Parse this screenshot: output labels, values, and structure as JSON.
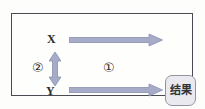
{
  "figure": {
    "nodes": {
      "x_label": "X",
      "y_label": "Y"
    },
    "annotations": {
      "arrow1_label": "①",
      "arrow2_label": "②"
    },
    "result_box_label": "结果",
    "colors": {
      "arrow_fill": "#a6abc7",
      "arrow_stroke": "#8890af",
      "frame_border": "#4a4a52",
      "result_fill": "#e9e9ef",
      "result_border": "#94949f",
      "text": "#2b2b2b"
    }
  }
}
